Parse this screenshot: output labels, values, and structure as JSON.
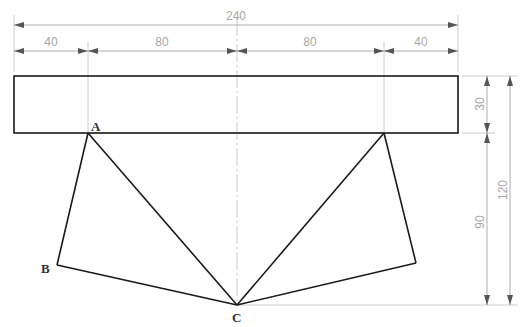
{
  "diagram": {
    "type": "engineering-drawing",
    "colors": {
      "outline": "#1a1a1a",
      "dimension": "#a8a8a8",
      "centerline": "#cfcfcf",
      "label": "#333333"
    },
    "dimensions": {
      "total_width": "240",
      "seg1": "40",
      "seg2": "80",
      "seg3": "80",
      "seg4": "40",
      "rect_height": "30",
      "lower_height": "90",
      "total_height": "120"
    },
    "points": {
      "a": "A",
      "b": "B",
      "c": "C"
    }
  }
}
